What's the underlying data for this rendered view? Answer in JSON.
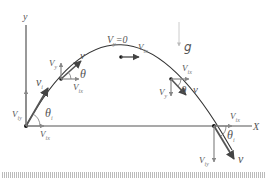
{
  "diagram": {
    "colors": {
      "axis": "#444444",
      "trajectory": "#333333",
      "vector": "#555555",
      "component": "#888888",
      "gravity": "#cccccc",
      "ground_hatch": "#bbbbbb",
      "point": "#111111"
    },
    "axes": {
      "y_label": "y",
      "x_label": "X"
    },
    "gravity": {
      "label": "g"
    },
    "points": [
      {
        "id": "launch",
        "velocity_label": "v",
        "velocity_sub": "i",
        "vx_label": "V",
        "vx_sub": "ix",
        "vy_label": "V",
        "vy_sub": "iy",
        "angle_label": "θ",
        "angle_sub": "i"
      },
      {
        "id": "ascending",
        "velocity_label": "v",
        "vx_label": "V",
        "vx_sub": "ix",
        "vy_label": "V",
        "vy_sub": "y",
        "angle_label": "θ"
      },
      {
        "id": "apex",
        "vy_label": "V",
        "vy_sub": "y",
        "vy_value": "=0",
        "vx_label": "V",
        "vx_sub": "ix"
      },
      {
        "id": "descending",
        "velocity_label": "v",
        "vx_label": "V",
        "vx_sub": "ix",
        "vy_label": "V",
        "vy_sub": "y",
        "angle_label": "θ"
      },
      {
        "id": "landing",
        "velocity_label": "v",
        "vx_label": "V",
        "vx_sub": "ix",
        "vy_label": "V",
        "vy_sub": "iy",
        "angle_label": "θ",
        "angle_sub": "i"
      }
    ]
  }
}
